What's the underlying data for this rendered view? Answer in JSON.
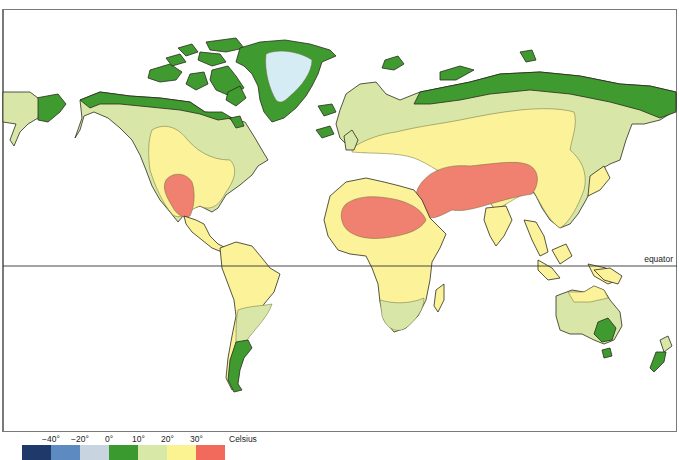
{
  "map": {
    "type": "world temperature zones map",
    "equator_label": "equator",
    "colors": {
      "ocean": "#ffffff",
      "ice_cap": "#d6ecf4",
      "cold_0_10": "#3f9a2f",
      "cool_10_20": "#d8e6a8",
      "warm_20_30": "#fbf29a",
      "hot_30_plus": "#f08070",
      "outline": "#2b2b1e"
    }
  },
  "legend": {
    "unit": "Celsius",
    "ticks": [
      "−40°",
      "−20°",
      "0°",
      "10°",
      "20°",
      "30°"
    ],
    "swatches": [
      {
        "range": "below -40",
        "color": "#1f3a6a"
      },
      {
        "range": "-40 to -20",
        "color": "#5d8ac0"
      },
      {
        "range": "-20 to 0",
        "color": "#c8d4e0"
      },
      {
        "range": "0 to 10",
        "color": "#3a9a30"
      },
      {
        "range": "10 to 20",
        "color": "#d8e8a6"
      },
      {
        "range": "20 to 30",
        "color": "#fbf291"
      },
      {
        "range": "above 30",
        "color": "#f26a5c"
      }
    ]
  }
}
